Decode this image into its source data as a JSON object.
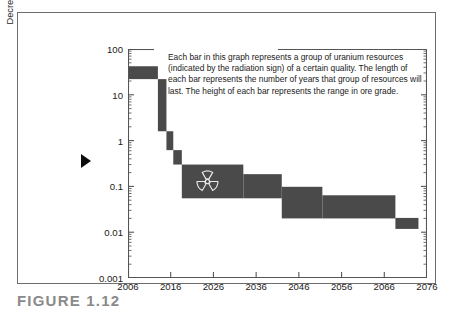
{
  "figure": {
    "caption": "FIGURE 1.12"
  },
  "annotation": {
    "text": "Each bar in this graph represents a group of uranium resources (indicated by the radiation sign) of a certain quality. The length of each bar represents the number of years that group of resources will last. The height of each bar represents the range in ore grade."
  },
  "axis_marker": {
    "name": "decreasing-direction-arrow"
  },
  "chart_data": {
    "type": "bar",
    "title": "",
    "subtitle": "",
    "xlabel": "",
    "ylabel": "Decreasing Uranium ore grade (m-% U3O8)",
    "ylabel_line1": "Decreasing Uranium ore grade",
    "ylabel_line2_prefix": "(m-% U",
    "ylabel_line2_sub": "3",
    "ylabel_line2_mid": "O",
    "ylabel_line2_sub2": "8",
    "ylabel_line2_suffix": ")",
    "yscale": "log",
    "ylim": [
      0.001,
      100
    ],
    "ytick_labels": [
      "100",
      "10",
      "1",
      "0.1",
      "0.01",
      "0.001"
    ],
    "ytick_values": [
      100,
      10,
      1,
      0.1,
      0.01,
      0.001
    ],
    "xscale": "linear",
    "xlim": [
      2006,
      2076
    ],
    "xtick_labels": [
      "2006",
      "2016",
      "2026",
      "2036",
      "2046",
      "2056",
      "2066",
      "2076"
    ],
    "xtick_values": [
      2006,
      2016,
      2026,
      2036,
      2046,
      2056,
      2066,
      2076
    ],
    "grid": false,
    "legend": "none",
    "bar_color": "#4a4a4a",
    "axis_color": "#555555",
    "bars": [
      {
        "x_start": 2006,
        "x_end": 2013.0,
        "y_low": 22.0,
        "y_high": 42.0,
        "label": "highest-grade-resources"
      },
      {
        "x_start": 2013.0,
        "x_end": 2015.0,
        "y_low": 1.6,
        "y_high": 22.0,
        "label": "grade-step-2"
      },
      {
        "x_start": 2015.0,
        "x_end": 2016.6,
        "y_low": 0.62,
        "y_high": 1.6,
        "label": "grade-step-3"
      },
      {
        "x_start": 2016.6,
        "x_end": 2018.6,
        "y_low": 0.3,
        "y_high": 0.62,
        "label": "grade-step-4"
      },
      {
        "x_start": 2018.6,
        "x_end": 2033.0,
        "y_low": 0.055,
        "y_high": 0.3,
        "label": "radiation-marked-resources"
      },
      {
        "x_start": 2033.0,
        "x_end": 2042.0,
        "y_low": 0.055,
        "y_high": 0.185,
        "label": "grade-step-6"
      },
      {
        "x_start": 2042.0,
        "x_end": 2051.5,
        "y_low": 0.02,
        "y_high": 0.098,
        "label": "grade-step-7"
      },
      {
        "x_start": 2051.5,
        "x_end": 2068.6,
        "y_low": 0.02,
        "y_high": 0.064,
        "label": "grade-step-8"
      },
      {
        "x_start": 2068.6,
        "x_end": 2074.0,
        "y_low": 0.0118,
        "y_high": 0.0205,
        "label": "lowest-grade-resources"
      }
    ],
    "markers": [
      {
        "type": "radiation-trefoil",
        "x": 2024.6,
        "y": 0.128
      }
    ]
  }
}
